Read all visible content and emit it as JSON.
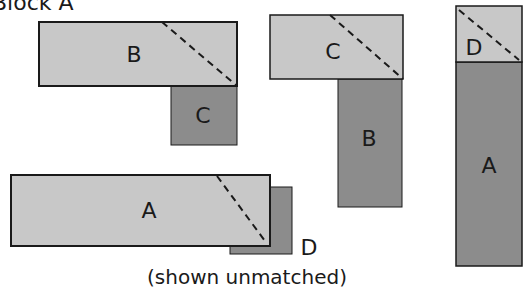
{
  "title": "Block A",
  "caption": "(shown unmatched)",
  "colors": {
    "light_fill": "#c8c8c8",
    "dark_fill": "#8c8c8c",
    "stroke": "#1a1a1a"
  },
  "groups": [
    {
      "name": "group-left-top",
      "pieces": [
        {
          "label": "B",
          "shade": "light",
          "role": "horizontal-strip",
          "dashed_diagonal": true
        },
        {
          "label": "C",
          "shade": "dark",
          "role": "square-below-right"
        }
      ]
    },
    {
      "name": "group-middle",
      "pieces": [
        {
          "label": "C",
          "shade": "light",
          "role": "horizontal-strip",
          "dashed_diagonal": true
        },
        {
          "label": "B",
          "shade": "dark",
          "role": "vertical-strip-below-right"
        }
      ]
    },
    {
      "name": "group-right",
      "pieces": [
        {
          "label": "D",
          "shade": "light",
          "role": "top-square",
          "dashed_diagonal": true
        },
        {
          "label": "A",
          "shade": "dark",
          "role": "vertical-strip"
        }
      ]
    },
    {
      "name": "group-left-bottom",
      "pieces": [
        {
          "label": "A",
          "shade": "light",
          "role": "horizontal-strip",
          "dashed_diagonal": true
        },
        {
          "label": "D",
          "shade": "dark",
          "role": "square-behind-offset"
        }
      ]
    }
  ],
  "labels": {
    "g1_b": "B",
    "g1_c": "C",
    "g2_c": "C",
    "g2_b": "B",
    "g3_d": "D",
    "g3_a": "A",
    "g4_a": "A",
    "g4_d": "D"
  }
}
